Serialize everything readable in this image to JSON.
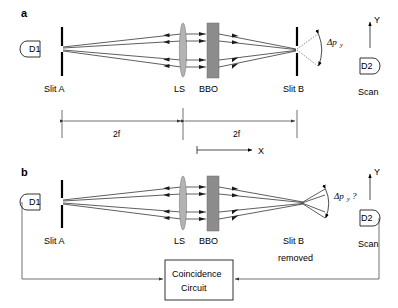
{
  "figure": {
    "panels": [
      {
        "id": "a",
        "label": "a",
        "detector_left": "D1",
        "detector_right": "D2",
        "scan_label": "Scan",
        "axis_y_label": "Y",
        "components": [
          {
            "name": "Slit A",
            "label": "Slit A"
          },
          {
            "name": "LS",
            "label": "LS"
          },
          {
            "name": "BBO",
            "label": "BBO"
          },
          {
            "name": "Slit B",
            "label": "Slit B"
          }
        ],
        "dimensions": [
          {
            "label": "2f"
          },
          {
            "label": "2f"
          }
        ],
        "momentum_label": "Δp",
        "momentum_subscript": "y",
        "momentum_suffix": ""
      },
      {
        "id": "b",
        "label": "b",
        "detector_left": "D1",
        "detector_right": "D2",
        "scan_label": "Scan",
        "axis_y_label": "Y",
        "axis_x_label": "X",
        "components": [
          {
            "name": "Slit A",
            "label": "Slit A"
          },
          {
            "name": "LS",
            "label": "LS"
          },
          {
            "name": "BBO",
            "label": "BBO"
          },
          {
            "name": "Slit B removed",
            "label_line1": "Slit B",
            "label_line2": "removed"
          }
        ],
        "momentum_label": "Δp",
        "momentum_subscript": "y",
        "momentum_suffix": "?",
        "coincidence": {
          "line1": "Coincidence",
          "line2": "Circuit"
        }
      }
    ],
    "colors": {
      "ink": "#000000",
      "ray": "#1a1a1a",
      "bbo": "#8c8c8c",
      "lens": "#b3b3b3",
      "wire": "#333333",
      "background": "#ffffff"
    }
  }
}
